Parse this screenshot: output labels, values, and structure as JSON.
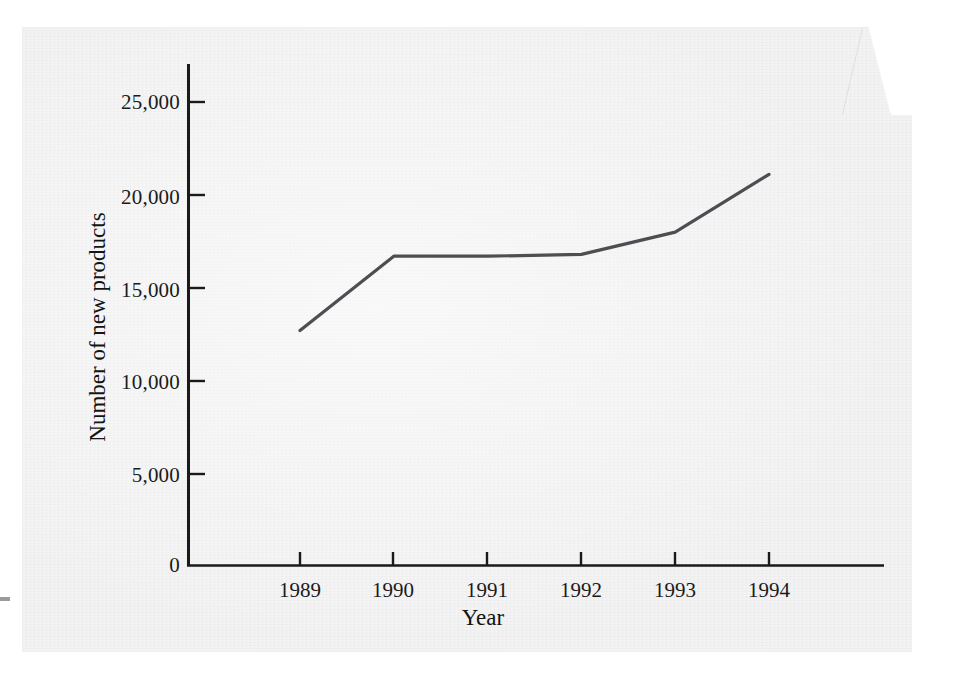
{
  "figure": {
    "background_color": "#f3f3f4",
    "axis_color": "#1a1a1a",
    "line_color": "#4d4d52"
  },
  "axes": {
    "ylabel": "Number of new products",
    "xlabel": "Year",
    "y_ticks": [
      "0",
      "5,000",
      "10,000",
      "15,000",
      "20,000",
      "25,000"
    ],
    "x_ticks": [
      "1989",
      "1990",
      "1991",
      "1992",
      "1993",
      "1994"
    ]
  },
  "chart_data": {
    "type": "line",
    "title": "",
    "xlabel": "Year",
    "ylabel": "Number of new products",
    "categories": [
      "1989",
      "1990",
      "1991",
      "1992",
      "1993",
      "1994"
    ],
    "x": [
      1989,
      1990,
      1991,
      1992,
      1993,
      1994
    ],
    "values": [
      12600,
      16600,
      16600,
      16700,
      17900,
      21000
    ],
    "series": [
      {
        "name": "Number of new products",
        "values": [
          12600,
          16600,
          16600,
          16700,
          17900,
          21000
        ]
      }
    ],
    "ylim": [
      0,
      26500
    ],
    "xlim": [
      1989,
      1994
    ],
    "y_tick_values": [
      0,
      5000,
      10000,
      15000,
      20000,
      25000
    ],
    "y_tick_labels": [
      "0",
      "5,000",
      "10,000",
      "15,000",
      "20,000",
      "25,000"
    ],
    "x_tick_labels": [
      "1989",
      "1990",
      "1991",
      "1992",
      "1993",
      "1994"
    ],
    "grid": false,
    "legend": false,
    "legend_position": "none",
    "markers": false,
    "annotations": []
  }
}
